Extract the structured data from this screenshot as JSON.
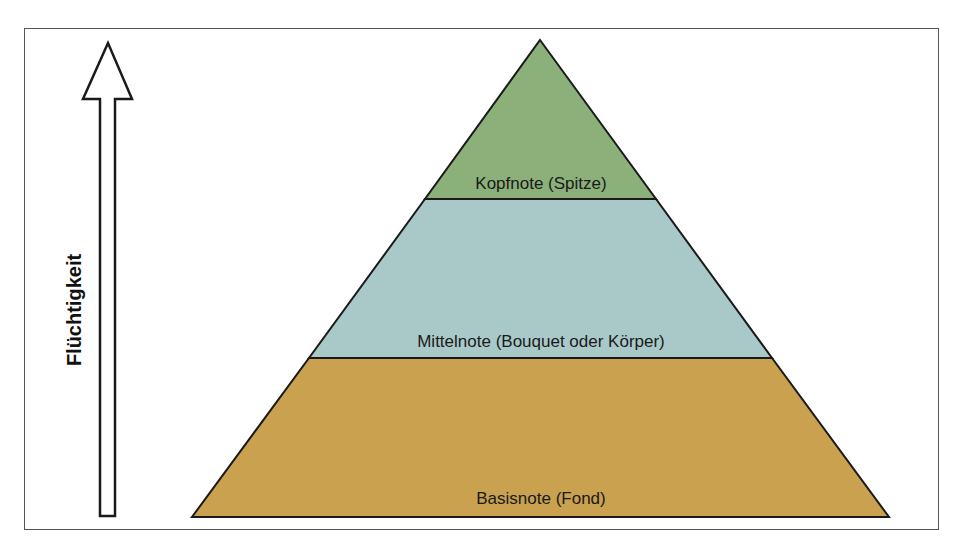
{
  "diagram": {
    "type": "pyramid",
    "axis": {
      "label": "Flüchtigkeit",
      "direction": "up"
    },
    "layers": [
      {
        "id": "top",
        "label": "Kopfnote (Spitze)",
        "color": "#8cb07a"
      },
      {
        "id": "middle",
        "label": "Mittelnote (Bouquet oder Körper)",
        "color": "#a9c9c8"
      },
      {
        "id": "base",
        "label": "Basisnote (Fond)",
        "color": "#c9a14f"
      }
    ],
    "colors": {
      "outline": "#1a1a1a",
      "frame": "#555555",
      "background": "#ffffff"
    }
  }
}
